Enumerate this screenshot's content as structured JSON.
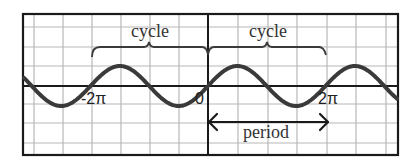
{
  "diagram": {
    "title": "",
    "colors": {
      "background": "#ffffff",
      "grid": "#b8b8b8",
      "axis": "#1a1a1a",
      "wave": "#3a3a3a"
    },
    "annotations": {
      "cycle_left": "cycle",
      "cycle_right": "cycle",
      "period": "period"
    },
    "x_tick_labels": {
      "neg_two_pi": "-2π",
      "zero": "0",
      "two_pi": "2π"
    }
  },
  "chart_data": {
    "type": "line",
    "title": "",
    "xlabel": "",
    "ylabel": "",
    "function": "y = sin(x)",
    "x_tick_labels": [
      "-2π",
      "0",
      "2π"
    ],
    "x_range": [
      -3.1,
      3.1
    ],
    "x_range_note": "in units of π (approx. -3.1π to 3.1π visible)",
    "grid": true,
    "annotations": [
      {
        "text": "cycle",
        "type": "brace",
        "from": "-2π",
        "to": "0"
      },
      {
        "text": "cycle",
        "type": "brace",
        "from": "0",
        "to": "2π"
      },
      {
        "text": "period",
        "type": "double-arrow",
        "from": "0",
        "to": "2π"
      }
    ]
  }
}
